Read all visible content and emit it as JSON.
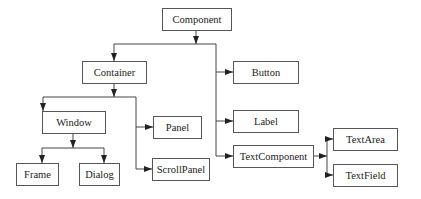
{
  "diagram": {
    "type": "class-hierarchy",
    "nodes": {
      "component": {
        "label": "Component",
        "x": 162,
        "y": 8,
        "w": 69,
        "h": 22
      },
      "container": {
        "label": "Container",
        "x": 82,
        "y": 61,
        "w": 64,
        "h": 22
      },
      "button": {
        "label": "Button",
        "x": 233,
        "y": 61,
        "w": 65,
        "h": 22
      },
      "window": {
        "label": "Window",
        "x": 42,
        "y": 111,
        "w": 63,
        "h": 22
      },
      "panel": {
        "label": "Panel",
        "x": 153,
        "y": 116,
        "w": 48,
        "h": 22
      },
      "label": {
        "label": "Label",
        "x": 233,
        "y": 110,
        "w": 65,
        "h": 22
      },
      "textcomponent": {
        "label": "TextComponent",
        "x": 233,
        "y": 145,
        "w": 80,
        "h": 22
      },
      "textarea": {
        "label": "TextArea",
        "x": 333,
        "y": 128,
        "w": 64,
        "h": 22
      },
      "textfield": {
        "label": "TextField",
        "x": 333,
        "y": 164,
        "w": 64,
        "h": 22
      },
      "frame": {
        "label": "Frame",
        "x": 16,
        "y": 163,
        "w": 42,
        "h": 22
      },
      "dialog": {
        "label": "Dialog",
        "x": 79,
        "y": 163,
        "w": 40,
        "h": 22
      },
      "scrollpanel": {
        "label": "ScrollPanel",
        "x": 152,
        "y": 158,
        "w": 57,
        "h": 22
      }
    },
    "edges": [
      {
        "from": "Component",
        "to": "Container"
      },
      {
        "from": "Component",
        "to": "Button"
      },
      {
        "from": "Component",
        "to": "Label"
      },
      {
        "from": "Component",
        "to": "TextComponent"
      },
      {
        "from": "Container",
        "to": "Window"
      },
      {
        "from": "Container",
        "to": "Panel"
      },
      {
        "from": "Container",
        "to": "ScrollPanel"
      },
      {
        "from": "Window",
        "to": "Frame"
      },
      {
        "from": "Window",
        "to": "Dialog"
      },
      {
        "from": "TextComponent",
        "to": "TextArea"
      },
      {
        "from": "TextComponent",
        "to": "TextField"
      }
    ]
  }
}
